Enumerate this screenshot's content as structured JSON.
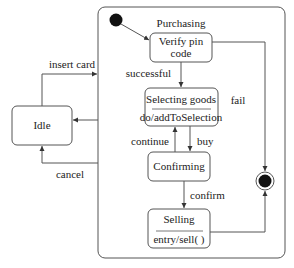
{
  "diagram": {
    "type": "uml-state-machine",
    "composite_state": {
      "name": "Purchasing"
    },
    "states": {
      "idle": {
        "name": "Idle"
      },
      "verify": {
        "name_line1": "Verify pin",
        "name_line2": "code"
      },
      "selecting": {
        "name": "Selecting goods",
        "action": "do/addToSelection"
      },
      "confirming": {
        "name": "Confirming"
      },
      "selling": {
        "name": "Selling",
        "action": "entry/sell( )"
      }
    },
    "transitions": {
      "insert_card": "insert card",
      "cancel": "cancel",
      "successful": "successful",
      "continue": "continue",
      "buy": "buy",
      "confirm": "confirm",
      "fail": "fail"
    },
    "colors": {
      "line": "#555555",
      "fill_dark": "#111111",
      "text": "#222222"
    }
  }
}
